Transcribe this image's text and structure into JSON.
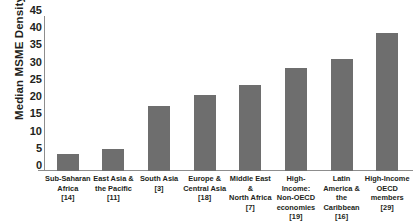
{
  "chart_data": {
    "type": "bar",
    "title": "",
    "xlabel": "",
    "ylabel": "Median MSME Density",
    "ylim": [
      0,
      45
    ],
    "ytick_step": 5,
    "yticks": [
      45,
      40,
      35,
      30,
      25,
      20,
      15,
      10,
      5,
      0
    ],
    "grid": false,
    "legend": "none",
    "bar_color": "#6e6e6e",
    "axis_color": "#8d8d8d",
    "categories": [
      "Sub-Saharan Africa",
      "East Asia & the Pacific",
      "South Asia",
      "Europe & Central Asia",
      "Middle East & North Africa",
      "High-Income: Non-OECD economies",
      "Latin America & the Caribbean",
      "High-Income OECD members"
    ],
    "category_lines": [
      [
        "Sub-Saharan",
        "Africa"
      ],
      [
        "East Asia &",
        "the Pacific"
      ],
      [
        "South Asia"
      ],
      [
        "Europe &",
        "Central Asia"
      ],
      [
        "Middle East &",
        "North Africa"
      ],
      [
        "High-Income:",
        "Non-OECD",
        "economies"
      ],
      [
        "Latin America &",
        "the Caribbean"
      ],
      [
        "High-Income",
        "OECD",
        "members"
      ]
    ],
    "category_counts": [
      "[14]",
      "[11]",
      "[3]",
      "[18]",
      "[7]",
      "[19]",
      "[16]",
      "[29]"
    ],
    "values": [
      5,
      6.5,
      19,
      22,
      25,
      30,
      32.5,
      40
    ]
  },
  "clipped_caption": ""
}
